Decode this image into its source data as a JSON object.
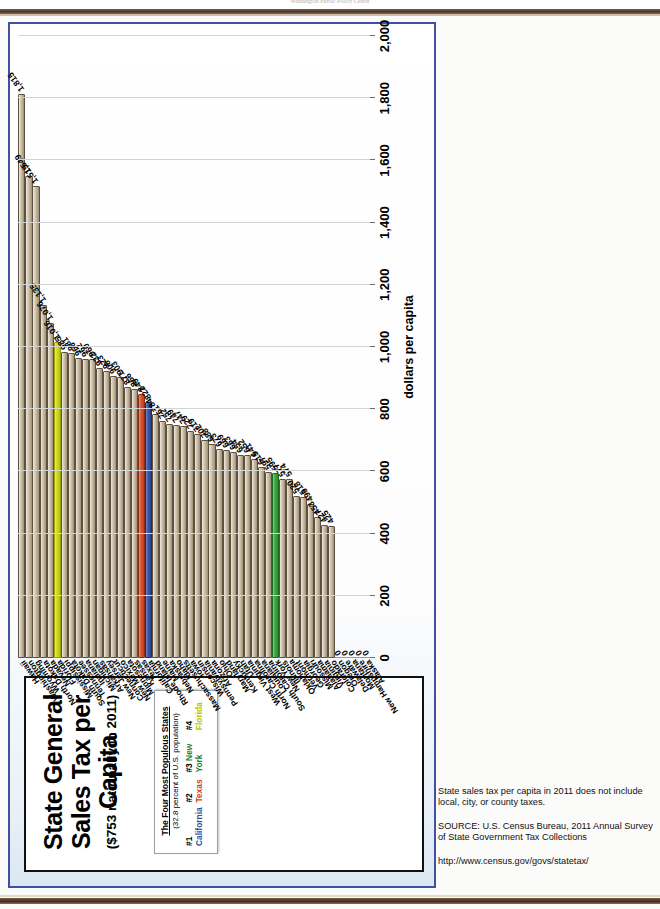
{
  "scan": {
    "header_faint": "Washington  Public Policy Center"
  },
  "slide": {
    "title": "State General Sales Tax per Capita",
    "subtitle": "($753 nationally in 2011)",
    "legend": {
      "heading": "The Four Most Populous States",
      "subheading": "(32.8 percent of U.S. population)",
      "entries": [
        {
          "rank": "#1",
          "state": "California",
          "color": "#2f52a0"
        },
        {
          "rank": "#2",
          "state": "Texas",
          "color": "#d0422a"
        },
        {
          "rank": "#3",
          "state": "New York",
          "color": "#1e7f2e"
        },
        {
          "rank": "#4",
          "state": "Florida",
          "color": "#b8c400"
        }
      ]
    }
  },
  "notes": [
    "State sales tax per capita in 2011 does not include local, city, or county taxes.",
    "SOURCE: U.S. Census Bureau, 2011 Annual Survey of State Government Tax Collections",
    "http://www.census.gov/govs/statetax/"
  ],
  "chart_data": {
    "type": "bar",
    "title": "State General Sales Tax per Capita",
    "subtitle": "($753 nationally in 2011)",
    "orientation": "horizontal",
    "xlabel": "dollars per capita",
    "ylabel": "",
    "xlim": [
      0,
      2000
    ],
    "xticks": [
      "0",
      "200",
      "400",
      "600",
      "800",
      "1,000",
      "1,200",
      "1,400",
      "1,600",
      "1,800",
      "2,000"
    ],
    "grid": "vertical",
    "legend_position": "title-box-left",
    "value_format": "comma-separated integers, shown at end of each bar",
    "categories": [
      "Hawaii",
      "Washington",
      "Wyoming",
      "North Dakota",
      "Nevada",
      "Florida",
      "Mississippi",
      "South Dakota",
      "Tennessee",
      "Indiana",
      "Michigan",
      "Arkansas",
      "New Jersey",
      "Connecticut",
      "New Mexico",
      "Minnesota",
      "Kansas",
      "Texas",
      "California",
      "Rhode Island",
      "Maine",
      "Nebraska",
      "Idaho",
      "Massachusetts",
      "Iowa",
      "Wisconsin",
      "Pennsylvania",
      "Arizona",
      "Ohio",
      "Maryland",
      "Kentucky",
      "Utah",
      "West Virginia",
      "North Carolina",
      "Louisiana",
      "South Carolina",
      "New York",
      "Illinois",
      "Oklahoma",
      "Vermont",
      "Georgia",
      "Missouri",
      "Alabama",
      "Virginia",
      "Colorado",
      "Oregon",
      "Delaware",
      "Montana",
      "New Hampshire",
      "Alaska"
    ],
    "values": [
      1815,
      1549,
      1519,
      1135,
      1076,
      1016,
      985,
      981,
      966,
      962,
      960,
      932,
      923,
      908,
      903,
      871,
      866,
      849,
      822,
      784,
      761,
      752,
      749,
      747,
      729,
      719,
      702,
      688,
      673,
      669,
      663,
      654,
      652,
      641,
      615,
      597,
      595,
      577,
      574,
      520,
      518,
      495,
      453,
      427,
      425,
      0,
      0,
      0,
      0,
      0
    ],
    "labels": [
      "1,815",
      "1,549",
      "1,519",
      "1,135",
      "1,076",
      "1,016",
      "985",
      "981",
      "966",
      "962",
      "960",
      "932",
      "923",
      "908",
      "903",
      "871",
      "866",
      "849",
      "822",
      "784",
      "761",
      "752",
      "749",
      "747",
      "729",
      "719",
      "702",
      "688",
      "673",
      "669",
      "663",
      "654",
      "652",
      "641",
      "615",
      "597",
      "595",
      "577",
      "574",
      "520",
      "518",
      "495",
      "453",
      "427",
      "425",
      "0",
      "0",
      "0",
      "0",
      "0"
    ],
    "highlight_colors": {
      "California": "#3a55a8",
      "Texas": "#d9542c",
      "New York": "#3aa83a",
      "Florida": "#cdd81c",
      "default": "#b5a78c"
    }
  }
}
